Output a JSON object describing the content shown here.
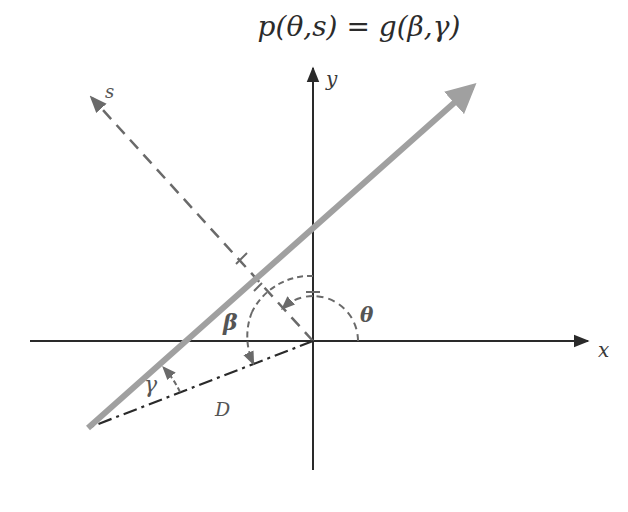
{
  "title": "p(θ,s) = g(β,γ)",
  "labels": {
    "x_axis": "x",
    "y_axis": "y",
    "s_axis": "s",
    "theta": "θ",
    "beta": "β",
    "gamma": "γ",
    "distance": "D"
  },
  "colors": {
    "axes": "#2a2a2a",
    "ray": "#a0a0a0",
    "dashed": "#6a6a6a",
    "background": "#ffffff"
  },
  "geometry": {
    "origin": [
      313,
      341
    ],
    "x_axis": {
      "from": [
        30,
        341
      ],
      "to": [
        590,
        341
      ]
    },
    "y_axis": {
      "from": [
        313,
        470
      ],
      "to": [
        313,
        65
      ]
    },
    "ray": {
      "from": [
        88,
        428
      ],
      "to": [
        480,
        80
      ]
    },
    "s_axis": {
      "from": [
        313,
        341
      ],
      "to": [
        88,
        95
      ]
    },
    "source_line_D": {
      "from": [
        313,
        341
      ],
      "to": [
        88,
        428
      ]
    }
  }
}
